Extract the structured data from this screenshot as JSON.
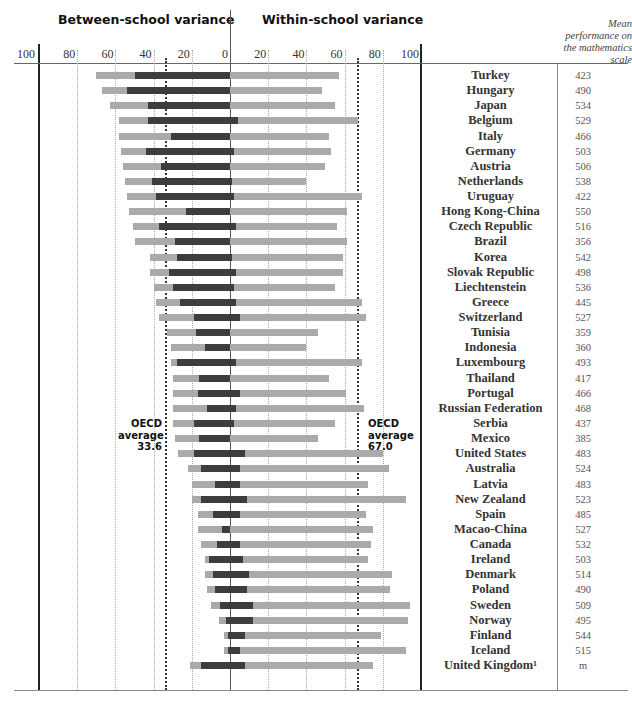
{
  "header": {
    "left_title": "Between-school variance",
    "right_title": "Within-school variance",
    "mean_title": "Mean performance on the mathematics scale"
  },
  "axis": {
    "left_ticks": [
      "100",
      "80",
      "60",
      "40",
      "20",
      "0"
    ],
    "right_ticks": [
      "20",
      "40",
      "60",
      "80",
      "100"
    ]
  },
  "oecd": {
    "between_label": [
      "OECD",
      "average",
      "33.6"
    ],
    "within_label": [
      "OECD",
      "average",
      "67.0"
    ],
    "between_value": 33.6,
    "within_value": 67.0
  },
  "colors": {
    "total_bar": "#aaaaaa",
    "explained_bar": "#3d3d3d"
  },
  "chart_data": {
    "type": "bar",
    "xlabel_left": "Between-school variance",
    "xlabel_right": "Within-school variance",
    "xlim": [
      -100,
      100
    ],
    "grid": true,
    "reference_lines": [
      {
        "label": "OECD average",
        "value": -33.6
      },
      {
        "label": "OECD average",
        "value": 67.0
      }
    ],
    "columns": [
      "country",
      "between_total",
      "between_explained",
      "within_explained",
      "within_total",
      "mean_math"
    ],
    "rows": [
      [
        "Turkey",
        70,
        50,
        0,
        57,
        "423"
      ],
      [
        "Hungary",
        67,
        54,
        0,
        48,
        "490"
      ],
      [
        "Japan",
        63,
        43,
        0,
        55,
        "534"
      ],
      [
        "Belgium",
        58,
        43,
        4,
        67,
        "529"
      ],
      [
        "Italy",
        58,
        31,
        0,
        52,
        "466"
      ],
      [
        "Germany",
        57,
        44,
        2,
        53,
        "503"
      ],
      [
        "Austria",
        56,
        36,
        0,
        50,
        "506"
      ],
      [
        "Netherlands",
        55,
        41,
        1,
        40,
        "538"
      ],
      [
        "Uruguay",
        54,
        39,
        2,
        69,
        "422"
      ],
      [
        "Hong Kong-China",
        53,
        23,
        0,
        61,
        "550"
      ],
      [
        "Czech Republic",
        51,
        37,
        3,
        56,
        "516"
      ],
      [
        "Brazil",
        50,
        29,
        0,
        61,
        "356"
      ],
      [
        "Korea",
        42,
        28,
        1,
        59,
        "542"
      ],
      [
        "Slovak Republic",
        42,
        32,
        3,
        59,
        "498"
      ],
      [
        "Liechtenstein",
        40,
        30,
        2,
        55,
        "536"
      ],
      [
        "Greece",
        39,
        26,
        3,
        69,
        "445"
      ],
      [
        "Switzerland",
        37,
        19,
        5,
        71,
        "527"
      ],
      [
        "Tunisia",
        33,
        18,
        0,
        46,
        "359"
      ],
      [
        "Indonesia",
        31,
        13,
        0,
        40,
        "360"
      ],
      [
        "Luxembourg",
        31,
        28,
        3,
        69,
        "493"
      ],
      [
        "Thailand",
        30,
        16,
        0,
        52,
        "417"
      ],
      [
        "Portugal",
        30,
        17,
        5,
        61,
        "466"
      ],
      [
        "Russian Federation",
        30,
        12,
        3,
        70,
        "468"
      ],
      [
        "Serbia",
        30,
        19,
        2,
        55,
        "437"
      ],
      [
        "Mexico",
        29,
        16,
        0,
        46,
        "385"
      ],
      [
        "United States",
        27,
        19,
        8,
        80,
        "483"
      ],
      [
        "Australia",
        22,
        15,
        5,
        83,
        "524"
      ],
      [
        "Latvia",
        20,
        8,
        5,
        72,
        "483"
      ],
      [
        "New Zealand",
        20,
        15,
        9,
        92,
        "523"
      ],
      [
        "Spain",
        17,
        9,
        5,
        71,
        "485"
      ],
      [
        "Macao-China",
        17,
        4,
        0,
        75,
        "527"
      ],
      [
        "Canada",
        15,
        7,
        5,
        74,
        "532"
      ],
      [
        "Ireland",
        13,
        11,
        7,
        72,
        "503"
      ],
      [
        "Denmark",
        13,
        9,
        10,
        85,
        "514"
      ],
      [
        "Poland",
        12,
        8,
        9,
        84,
        "490"
      ],
      [
        "Sweden",
        10,
        5,
        12,
        94,
        "509"
      ],
      [
        "Norway",
        6,
        2,
        12,
        93,
        "495"
      ],
      [
        "Finland",
        3,
        1,
        8,
        79,
        "544"
      ],
      [
        "Iceland",
        3,
        1,
        5,
        92,
        "515"
      ],
      [
        "United Kingdom¹",
        21,
        15,
        8,
        75,
        "m"
      ]
    ]
  }
}
